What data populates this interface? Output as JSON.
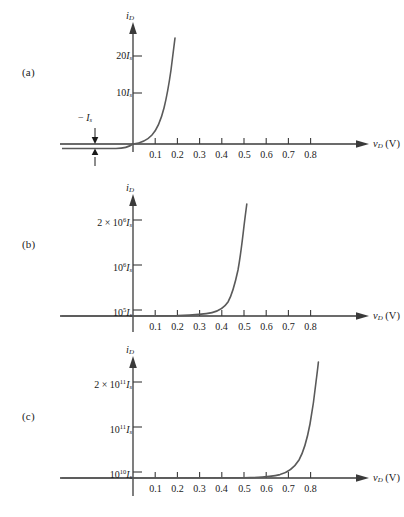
{
  "figure": {
    "background": "#ffffff",
    "curve_color": "#5a5a5a",
    "axis_color": "#3a3a3a"
  },
  "panels": [
    {
      "id": "a",
      "label": "(a)",
      "y_axis_title": "i_D",
      "x_axis_title": "v_D (V)",
      "y_ticks": [
        {
          "label_html": "10<i>I</i><span class=\"sub\">s</span>",
          "text": "10I_s",
          "value": 10
        },
        {
          "label_html": "20<i>I</i><span class=\"sub\">s</span>",
          "text": "20I_s",
          "value": 20
        }
      ],
      "x_ticks": [
        "0.1",
        "0.2",
        "0.3",
        "0.4",
        "0.5",
        "0.6",
        "0.7",
        "0.8"
      ],
      "annotation": {
        "text": "-I_s",
        "html": "&minus; <i>I</i><span class=\"sub\">s</span>"
      }
    },
    {
      "id": "b",
      "label": "(b)",
      "y_axis_title": "i_D",
      "x_axis_title": "v_D (V)",
      "y_ticks": [
        {
          "label_html": "10<sup>5</sup><i>I</i><span class=\"sub\">s</span>",
          "text": "10^5 I_s",
          "value": 100000
        },
        {
          "label_html": "10<sup>6</sup><i>I</i><span class=\"sub\">s</span>",
          "text": "10^6 I_s",
          "value": 1000000
        },
        {
          "label_html": "2 &times; 10<sup>6</sup><i>I</i><span class=\"sub\">s</span>",
          "text": "2 x 10^6 I_s",
          "value": 2000000
        }
      ],
      "x_ticks": [
        "0.1",
        "0.2",
        "0.3",
        "0.4",
        "0.5",
        "0.6",
        "0.7",
        "0.8"
      ],
      "annotation": null
    },
    {
      "id": "c",
      "label": "(c)",
      "y_axis_title": "i_D",
      "x_axis_title": "v_D (V)",
      "y_ticks": [
        {
          "label_html": "10<sup>10</sup><i>I</i><span class=\"sub\">s</span>",
          "text": "10^10 I_s",
          "value": 10000000000
        },
        {
          "label_html": "10<sup>11</sup><i>I</i><span class=\"sub\">s</span>",
          "text": "10^11 I_s",
          "value": 100000000000
        },
        {
          "label_html": "2 &times; 10<sup>11</sup><i>I</i><span class=\"sub\">s</span>",
          "text": "2 x 10^11 I_s",
          "value": 200000000000
        }
      ],
      "x_ticks": [
        "0.1",
        "0.2",
        "0.3",
        "0.4",
        "0.5",
        "0.6",
        "0.7",
        "0.8"
      ],
      "annotation": null
    }
  ],
  "chart_data": [
    {
      "type": "line",
      "title": "(a) Diode i-v characteristic, linear scale 20 I_s",
      "xlabel": "v_D (V)",
      "ylabel": "i_D",
      "xlim": [
        -0.35,
        0.88
      ],
      "ylim": [
        -1,
        26
      ],
      "grid": false,
      "legend": null,
      "xticks": [
        0.1,
        0.2,
        0.3,
        0.4,
        0.5,
        0.6,
        0.7,
        0.8
      ],
      "yticks": [
        10,
        20
      ],
      "ytick_labels": [
        "10I_s",
        "20I_s"
      ],
      "annotations": [
        "-I_s"
      ],
      "series": [
        {
          "name": "i_D = I_s(e^(v_D/V_T) - 1)",
          "x": [
            -0.35,
            -0.3,
            -0.25,
            -0.2,
            -0.15,
            -0.1,
            -0.05,
            -0.02,
            0.0,
            0.02,
            0.04,
            0.06,
            0.08,
            0.1,
            0.12,
            0.14,
            0.15,
            0.16,
            0.17
          ],
          "y": [
            -1,
            -1,
            -1,
            -1,
            -1,
            -1,
            -0.86,
            -0.55,
            0,
            1.16,
            3.6,
            8.9,
            20.0,
            42.0,
            91.0,
            196.0,
            287.0,
            421.0,
            617.0
          ],
          "y_clipped_max": 26
        }
      ]
    },
    {
      "type": "line",
      "title": "(b) Diode i-v characteristic, scale 2 x 10^6 I_s",
      "xlabel": "v_D (V)",
      "ylabel": "i_D",
      "xlim": [
        -0.35,
        0.88
      ],
      "ylim": [
        0,
        2400000
      ],
      "grid": false,
      "legend": null,
      "xticks": [
        0.1,
        0.2,
        0.3,
        0.4,
        0.5,
        0.6,
        0.7,
        0.8
      ],
      "yticks": [
        100000,
        1000000,
        2000000
      ],
      "ytick_labels": [
        "10^5 I_s",
        "10^6 I_s",
        "2 x 10^6 I_s"
      ],
      "annotations": [],
      "series": [
        {
          "name": "i_D = I_s(e^(v_D/V_T) - 1)",
          "x": [
            0.0,
            0.05,
            0.1,
            0.15,
            0.2,
            0.24,
            0.26,
            0.28,
            0.3,
            0.32,
            0.34,
            0.35,
            0.36,
            0.37
          ],
          "y": [
            0,
            7,
            42,
            290,
            1980,
            9200,
            20000,
            42000,
            91000,
            196000,
            421000,
            617000,
            905000,
            1330000
          ],
          "y_clipped_max": 2400000
        }
      ]
    },
    {
      "type": "line",
      "title": "(c) Diode i-v characteristic, scale 2 x 10^11 I_s",
      "xlabel": "v_D (V)",
      "ylabel": "i_D",
      "xlim": [
        -0.35,
        0.88
      ],
      "ylim": [
        0,
        240000000000
      ],
      "grid": false,
      "legend": null,
      "xticks": [
        0.1,
        0.2,
        0.3,
        0.4,
        0.5,
        0.6,
        0.7,
        0.8
      ],
      "yticks": [
        10000000000,
        100000000000,
        200000000000
      ],
      "ytick_labels": [
        "10^10 I_s",
        "10^11 I_s",
        "2 x 10^11 I_s"
      ],
      "annotations": [],
      "series": [
        {
          "name": "i_D = I_s(e^(v_D/V_T) - 1)",
          "x": [
            0.0,
            0.1,
            0.2,
            0.3,
            0.4,
            0.48,
            0.52,
            0.55,
            0.58,
            0.6,
            0.62,
            0.64,
            0.65,
            0.66
          ],
          "y": [
            0,
            42,
            1980,
            91000,
            4200000,
            91000000,
            420000000,
            1330000000,
            4200000000,
            9100000000,
            19600000000,
            42100000000,
            61700000000,
            90500000000
          ],
          "y_clipped_max": 240000000000
        }
      ]
    }
  ]
}
